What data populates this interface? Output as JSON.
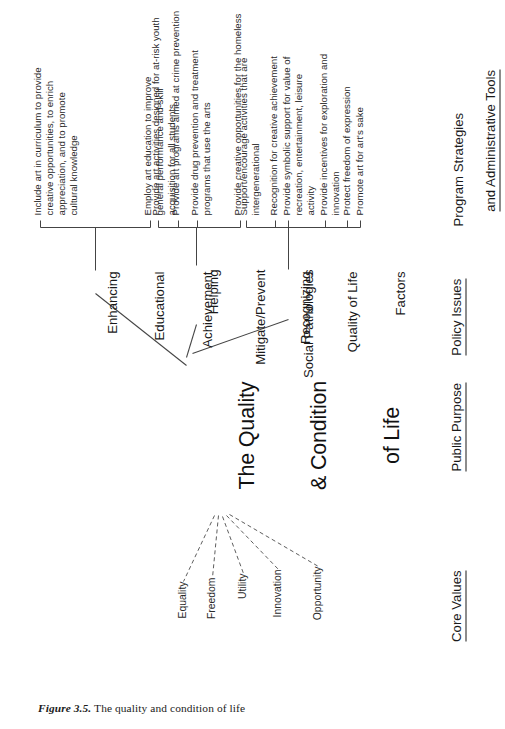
{
  "figure": {
    "number_label": "Figure 3.5.",
    "caption": " The quality and condition of life"
  },
  "hub": {
    "line1": "The Quality",
    "line2": "& Condition",
    "line3": "of Life"
  },
  "columns": [
    {
      "id": "core-values",
      "label": "Core Values"
    },
    {
      "id": "public-purpose",
      "label": "Public Purpose"
    },
    {
      "id": "policy-issues",
      "label": "Policy Issues"
    },
    {
      "id": "program-strategies",
      "line1": "Program Strategies",
      "line2": "and Administrative Tools"
    }
  ],
  "core_values": [
    {
      "label": "Equality"
    },
    {
      "label": "Freedom"
    },
    {
      "label": "Utility"
    },
    {
      "label": "Innovation"
    },
    {
      "label": "Opportunity"
    }
  ],
  "branches": [
    {
      "id": "enhancing-educational-achievement",
      "title_line1": "Enhancing",
      "title_line2": "Educational",
      "title_line3": "Achievement",
      "leaves": [
        {
          "text": "Include art in curriculum to provide\ncreative opportunities, to enrich\nappreciation, and to promote\ncultural knowledge"
        },
        {
          "text": "Employ art education to improve\ngeneral performance and skill\nacquisition for all students"
        }
      ]
    },
    {
      "id": "helping-mitigate-prevent-social-pathologies",
      "title_line1": "Helping",
      "title_line2": "Mitigate/Prevent",
      "title_line3": "Social Pathologies",
      "leaves": [
        {
          "text": "Provide art activities designed for at-risk youth"
        },
        {
          "text": "Provide art programs aimed at crime prevention"
        },
        {
          "text": "Provide drug prevention and treatment\nprograms that use the arts"
        },
        {
          "text": "Provide creative opportunities for the homeless"
        }
      ]
    },
    {
      "id": "recognizing-quality-of-life-factors",
      "title_line1": "Recognizing",
      "title_line2": "Quality of Life",
      "title_line3": "Factors",
      "leaves": [
        {
          "text": "Support/encourage activities that are\nintergenerational"
        },
        {
          "text": "Recognition for creative achievement"
        },
        {
          "text": "Provide symbolic support for value of\nrecreation, entertainment, leisure\nactivity"
        },
        {
          "text": "Provide incentives for exploration and\ninnovation"
        },
        {
          "text": "Protect freedom of expression"
        },
        {
          "text": "Promote art for art's sake"
        }
      ]
    }
  ],
  "style": {
    "ink": "#1b1b1b",
    "paper": "#ffffff"
  }
}
